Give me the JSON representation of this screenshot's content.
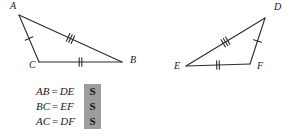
{
  "figure": {
    "type": "congruent-triangles-sss",
    "triangles": [
      {
        "name": "triangle-abc",
        "vertices": [
          {
            "label": "A",
            "x": 19,
            "y": 15,
            "label_x": 10,
            "label_y": 9
          },
          {
            "label": "C",
            "x": 39,
            "y": 62,
            "label_x": 29,
            "label_y": 68
          },
          {
            "label": "B",
            "x": 122,
            "y": 62,
            "label_x": 130,
            "label_y": 63
          }
        ],
        "sides": [
          {
            "name": "AC",
            "from": "A",
            "to": "C",
            "ticks": 1
          },
          {
            "name": "CB",
            "from": "C",
            "to": "B",
            "ticks": 2
          },
          {
            "name": "AB",
            "from": "A",
            "to": "B",
            "ticks": 3
          }
        ]
      },
      {
        "name": "triangle-def",
        "vertices": [
          {
            "label": "D",
            "x": 265,
            "y": 18,
            "label_x": 274,
            "label_y": 10
          },
          {
            "label": "E",
            "x": 186,
            "y": 66,
            "label_x": 174,
            "label_y": 69
          },
          {
            "label": "F",
            "x": 250,
            "y": 64,
            "label_x": 257,
            "label_y": 69
          }
        ],
        "sides": [
          {
            "name": "DF",
            "from": "D",
            "to": "F",
            "ticks": 1
          },
          {
            "name": "EF",
            "from": "E",
            "to": "F",
            "ticks": 2
          },
          {
            "name": "ED",
            "from": "E",
            "to": "D",
            "ticks": 3
          }
        ]
      }
    ]
  },
  "statements": {
    "rows": [
      {
        "left": "AB",
        "op": "=",
        "right": "DE",
        "badge": "S"
      },
      {
        "left": "BC",
        "op": "=",
        "right": "EF",
        "badge": "S"
      },
      {
        "left": "AC",
        "op": "=",
        "right": "DF",
        "badge": "S"
      }
    ]
  },
  "colors": {
    "stroke": "#2b2b2b",
    "badge_background": "#9d9d9d",
    "text": "#1a1a1a",
    "page_background": "#ffffff"
  }
}
